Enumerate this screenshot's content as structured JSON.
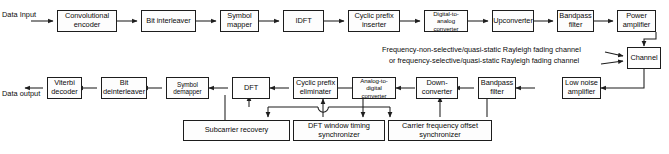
{
  "diagram": {
    "labels": {
      "data_input": "Data Input",
      "data_output": "Data output",
      "channel_note_1": "Frequency-non-selective/quasi-static Rayleigh fading channel",
      "channel_note_2": "or frequency-selective/quasi-static Rayleigh fading channel"
    },
    "transmitter_chain": [
      {
        "id": "conv-encoder",
        "label": "Convolutional encoder"
      },
      {
        "id": "bit-interleaver",
        "label": "Bit interleaver"
      },
      {
        "id": "symbol-mapper",
        "label": "Symbol mapper"
      },
      {
        "id": "idft",
        "label": "IDFT"
      },
      {
        "id": "cyclic-prefix-inserter",
        "label": "Cyclic prefix inserter"
      },
      {
        "id": "dac",
        "label": "Digital-to-analog converter"
      },
      {
        "id": "upconverter",
        "label": "Upconverter"
      },
      {
        "id": "bandpass-filter-tx",
        "label": "Bandpass filter"
      },
      {
        "id": "power-amplifier",
        "label": "Power amplifier"
      }
    ],
    "channel_block": {
      "id": "channel",
      "label": "Channel"
    },
    "receiver_chain": [
      {
        "id": "low-noise-amplifier",
        "label": "Low noise amplifier"
      },
      {
        "id": "bandpass-filter-rx",
        "label": "Bandpass filter"
      },
      {
        "id": "down-converter",
        "label": "Down-converter"
      },
      {
        "id": "adc",
        "label": "Analog-to-digital converter"
      },
      {
        "id": "cyclic-prefix-eliminater",
        "label": "Cyclic prefix eliminater"
      },
      {
        "id": "dft",
        "label": "DFT"
      },
      {
        "id": "symbol-demapper",
        "label": "Symbol demapper"
      },
      {
        "id": "bit-deinterleaver",
        "label": "Bit deinterleaver"
      },
      {
        "id": "viterbi-decoder",
        "label": "Viterbi decoder"
      }
    ],
    "sync_blocks": [
      {
        "id": "subcarrier-recovery",
        "label": "Subcarrier recovery"
      },
      {
        "id": "dft-window-timing-synchronizer",
        "label": "DFT window timing synchronizer"
      },
      {
        "id": "carrier-frequency-offset-synchronizer",
        "label": "Carrier frequency offset synchronizer"
      }
    ],
    "colors": {
      "stroke": "#1d1d1d",
      "text": "#0b0b0b",
      "background": "#ffffff",
      "box_fill": "#fdfdfd"
    }
  }
}
